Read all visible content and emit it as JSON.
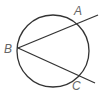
{
  "diagram": {
    "type": "geometry",
    "circle": {
      "cx": 53,
      "cy": 51,
      "r": 36,
      "stroke": "#333333"
    },
    "points": [
      {
        "label": "A",
        "x": 78,
        "y": 23,
        "label_x": 74,
        "label_y": 15
      },
      {
        "label": "B",
        "x": 18,
        "y": 48,
        "label_x": 4,
        "label_y": 53
      },
      {
        "label": "C",
        "x": 78,
        "y": 74,
        "label_x": 72,
        "label_y": 90
      }
    ],
    "rays": [
      {
        "from": "B",
        "through": "A",
        "x2": 98,
        "y2": 15
      },
      {
        "from": "B",
        "through": "C",
        "x2": 95,
        "y2": 83
      }
    ]
  }
}
